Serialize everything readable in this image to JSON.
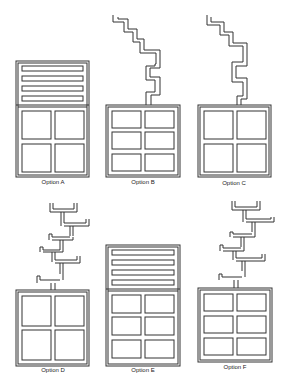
{
  "options": [
    {
      "id": "A",
      "label": "Option A",
      "type": "bars-top",
      "grid_rows": 2,
      "grid_cols": 2
    },
    {
      "id": "B",
      "label": "Option B",
      "type": "zigzag-path",
      "grid_rows": 3,
      "grid_cols": 2
    },
    {
      "id": "C",
      "label": "Option C",
      "type": "zigzag-path",
      "grid_rows": 2,
      "grid_cols": 2
    },
    {
      "id": "D",
      "label": "Option D",
      "type": "branching-tree",
      "grid_rows": 2,
      "grid_cols": 2
    },
    {
      "id": "E",
      "label": "Option E",
      "type": "bars-top",
      "grid_rows": 3,
      "grid_cols": 2
    },
    {
      "id": "F",
      "label": "Option F",
      "type": "branching-tree",
      "grid_rows": 3,
      "grid_cols": 2
    }
  ],
  "colors": {
    "stroke": "#333333",
    "background": "#ffffff"
  }
}
